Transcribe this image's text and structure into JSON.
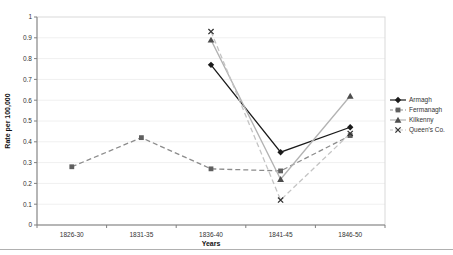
{
  "figure": {
    "background": "#ffffff",
    "plot_border_color": "#d9d9d9",
    "axis_color": "#808080",
    "gridline_color": "#f0f0f0",
    "bottom_rule_color": "#b0b0b0",
    "tick_label_color": "#333333"
  },
  "chart_data": {
    "type": "line",
    "title": "",
    "xlabel": "Years",
    "ylabel": "Rate per 100,000",
    "categories": [
      "1826-30",
      "1831-35",
      "1836-40",
      "1841-45",
      "1846-50"
    ],
    "ylim": [
      0,
      1
    ],
    "ytick_step": 0.1,
    "yticks": [
      "0",
      "0.1",
      "0.2",
      "0.3",
      "0.4",
      "0.5",
      "0.6",
      "0.7",
      "0.8",
      "0.9",
      "1"
    ],
    "grid": true,
    "legend_position": "right",
    "series": [
      {
        "name": "Armagh",
        "values": [
          null,
          null,
          0.77,
          0.35,
          0.47
        ],
        "line_color": "#1a1a1a",
        "line_style": "solid",
        "marker": "diamond",
        "marker_color": "#1a1a1a"
      },
      {
        "name": "Fermanagh",
        "values": [
          0.28,
          0.42,
          0.27,
          0.26,
          0.43
        ],
        "line_color": "#8c8c8c",
        "line_style": "dashed",
        "marker": "square",
        "marker_color": "#5f5f5f"
      },
      {
        "name": "Kilkenny",
        "values": [
          null,
          null,
          0.89,
          0.22,
          0.62
        ],
        "line_color": "#b3b3b3",
        "line_style": "solid",
        "marker": "triangle",
        "marker_color": "#4d4d4d"
      },
      {
        "name": "Queen's Co.",
        "values": [
          null,
          null,
          0.93,
          0.12,
          0.44
        ],
        "line_color": "#c4c4c4",
        "line_style": "dashed",
        "marker": "x",
        "marker_color": "#333333"
      }
    ]
  }
}
